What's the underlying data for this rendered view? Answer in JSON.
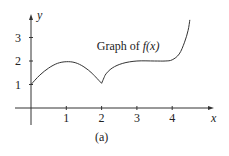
{
  "chart_data": {
    "type": "line",
    "title": "Graph of f(x)",
    "annotation": {
      "text_prefix": "Graph of ",
      "func": "f",
      "arg": "(x)",
      "anchor": [
        2.75,
        2.45
      ]
    },
    "xlabel": "x",
    "ylabel": "y",
    "caption": "(a)",
    "xlim": [
      -0.45,
      5.35
    ],
    "ylim": [
      -0.1,
      3.3
    ],
    "xticks": [
      1,
      2,
      3,
      4
    ],
    "yticks": [
      1,
      2,
      3
    ],
    "xtick_labels": [
      "1",
      "2",
      "3",
      "4"
    ],
    "ytick_labels": [
      "1",
      "2",
      "3"
    ],
    "grid": false,
    "series": [
      {
        "name": "f(x)",
        "points": [
          [
            0,
            1.0
          ],
          [
            0.25,
            1.4
          ],
          [
            0.5,
            1.7
          ],
          [
            0.75,
            1.9
          ],
          [
            1,
            1.97
          ],
          [
            1.25,
            1.93
          ],
          [
            1.5,
            1.75
          ],
          [
            1.75,
            1.45
          ],
          [
            2,
            1.05
          ],
          [
            2.1,
            1.4
          ],
          [
            2.3,
            1.7
          ],
          [
            2.6,
            1.9
          ],
          [
            3,
            2.0
          ],
          [
            3.5,
            2.0
          ],
          [
            3.8,
            2.0
          ],
          [
            4,
            2.05
          ],
          [
            4.2,
            2.3
          ],
          [
            4.35,
            2.8
          ],
          [
            4.45,
            3.3
          ],
          [
            4.5,
            3.75
          ]
        ]
      }
    ]
  }
}
